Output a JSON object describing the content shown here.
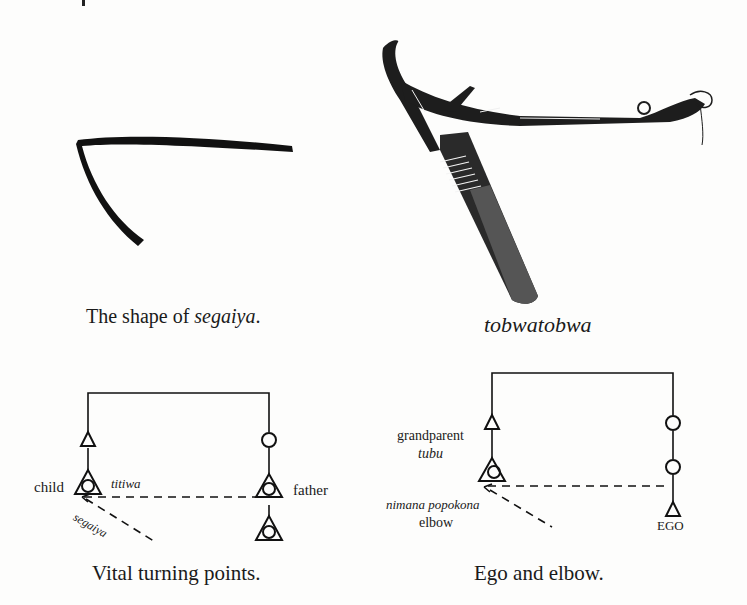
{
  "figure_top_left": {
    "caption_prefix": "The shape of ",
    "caption_term": "segaiya",
    "caption_suffix": "."
  },
  "figure_top_right": {
    "caption": "tobwatobwa",
    "illustration": "carved wooden tobwatobwa implement"
  },
  "diagram_left": {
    "caption": "Vital turning points.",
    "labels": {
      "child": "child",
      "titiwa": "titiwa",
      "segaiya": "segaiya",
      "father": "father"
    }
  },
  "diagram_right": {
    "caption": "Ego and elbow.",
    "labels": {
      "grandparent": "grandparent",
      "tubu": "tubu",
      "nimana_popokona": "nimana popokona",
      "elbow": "elbow",
      "ego": "EGO"
    }
  }
}
